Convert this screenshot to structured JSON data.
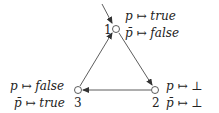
{
  "nodes": [
    {
      "id": "1",
      "label": "1",
      "assign_p": "p ↦ true",
      "assign_pbar": "p̄ ↦ false"
    },
    {
      "id": "2",
      "label": "2",
      "assign_p": "p ↦ ⊥",
      "assign_pbar": "p̄ ↦ ⊥"
    },
    {
      "id": "3",
      "label": "3",
      "assign_p": "p ↦ false",
      "assign_pbar": "p̄ ↦ true"
    }
  ],
  "edges": [
    {
      "from": "start",
      "to": "1"
    },
    {
      "from": "1",
      "to": "2"
    },
    {
      "from": "2",
      "to": "3"
    },
    {
      "from": "3",
      "to": "1"
    }
  ]
}
